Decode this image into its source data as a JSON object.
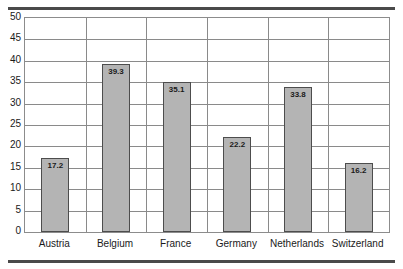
{
  "chart_data": {
    "type": "bar",
    "title": "",
    "subtitle": "",
    "xlabel": "",
    "ylabel": "",
    "categories": [
      "Austria",
      "Belgium",
      "France",
      "Germany",
      "Netherlands",
      "Switzerland"
    ],
    "values": [
      17.2,
      39.3,
      35.1,
      22.2,
      33.8,
      16.2
    ],
    "value_labels": [
      "17.2",
      "39.3",
      "35.1",
      "22.2",
      "33.8",
      "16.2"
    ],
    "ylim": [
      0,
      50
    ],
    "ytick_step": 5,
    "ytick_labels": [
      "50",
      "45",
      "40",
      "35",
      "30",
      "25",
      "20",
      "15",
      "10",
      "5",
      "0"
    ],
    "ytick_values": [
      50,
      45,
      40,
      35,
      30,
      25,
      20,
      15,
      10,
      5,
      0
    ],
    "grid": {
      "horizontal": true,
      "vertical": true
    },
    "legend": {
      "visible": false,
      "position": "none",
      "entries": []
    },
    "colors": {
      "bar_fill": "#b4b4b4",
      "bar_border": "#4d4d4d",
      "gridline": "#8a8a8a",
      "frame": "#8c8c8c",
      "rule": "#4a4a4a",
      "text": "#1a1a1a",
      "background": "#ffffff"
    }
  }
}
